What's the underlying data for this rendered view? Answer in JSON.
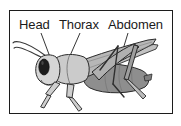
{
  "figure": {
    "frame": {
      "border_color": "#1c1c1c",
      "background_color": "#ffffff"
    },
    "labels": [
      {
        "id": "head",
        "text": "Head",
        "x": 19,
        "y": 29,
        "leader_from": [
          41,
          33
        ],
        "leader_to": [
          50,
          57
        ]
      },
      {
        "id": "thorax",
        "text": "Thorax",
        "x": 59,
        "y": 29,
        "leader_from": [
          80,
          33
        ],
        "leader_to": [
          69,
          58
        ]
      },
      {
        "id": "abdomen",
        "text": "Abdomen",
        "x": 108,
        "y": 29,
        "leader_from": [
          128,
          33
        ],
        "leader_to": [
          113,
          82
        ]
      }
    ],
    "illustration": {
      "subject": "grasshopper",
      "orientation": "side view facing left",
      "colors": {
        "outline": "#2a2a2a",
        "head": "#d8d8d8",
        "eye": "#1a1a1a",
        "thorax": "#c9c9c9",
        "abdomen": "#8e8e8e",
        "wing": "#b5b5b5",
        "legs": "#cfcfcf",
        "antenna": "#3a3a3a"
      },
      "parts": [
        "antennae",
        "head",
        "compound-eye",
        "thorax",
        "abdomen",
        "forewing",
        "hindwing",
        "front-legs",
        "middle-legs",
        "hind-jumping-legs"
      ]
    }
  }
}
